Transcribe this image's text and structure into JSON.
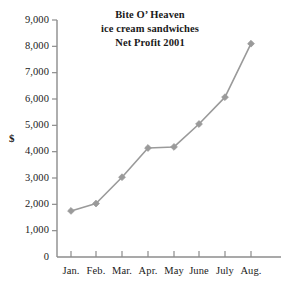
{
  "chart_data": {
    "type": "line",
    "title_lines": [
      "Bite O’ Heaven",
      "ice cream sandwiches",
      "Net Profit 2001"
    ],
    "xlabel": "",
    "ylabel": "$",
    "categories": [
      "Jan.",
      "Feb.",
      "Mar.",
      "Apr.",
      "May",
      "June",
      "July",
      "Aug."
    ],
    "values": [
      1750,
      2030,
      3030,
      4140,
      4180,
      5050,
      6070,
      8100
    ],
    "ylim": [
      0,
      9000
    ],
    "ytick_step": 1000,
    "ytick_labels": [
      "9,000",
      "8,000",
      "7,000",
      "6,000",
      "5,000",
      "4,000",
      "3,000",
      "2,000",
      "1,000",
      "0"
    ],
    "ytick_values": [
      9000,
      8000,
      7000,
      6000,
      5000,
      4000,
      3000,
      2000,
      1000,
      0
    ],
    "grid": false,
    "legend": false,
    "legend_position": "none",
    "series": [
      {
        "name": "Net Profit",
        "values": [
          1750,
          2030,
          3030,
          4140,
          4180,
          5050,
          6070,
          8100
        ]
      }
    ],
    "marker": "diamond",
    "line_color": "#9a9a9a",
    "marker_color": "#9a9a9a",
    "axis_color": "#8c8c8c",
    "text_color": "#1a1a1a",
    "background_color": "#ffffff"
  },
  "layout": {
    "plot_left": 57,
    "plot_baseline": 257,
    "plot_top": 20,
    "plot_right": 281,
    "x_positions": [
      71,
      96,
      122,
      148,
      174,
      199,
      225,
      251
    ]
  }
}
